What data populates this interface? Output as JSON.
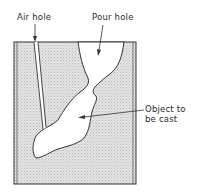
{
  "diagram": {
    "labels": {
      "air_hole": "Air hole",
      "pour_hole": "Pour hole",
      "object_line1": "Object to",
      "object_line2": "be cast"
    },
    "colors": {
      "mould_fill": "#d9d9d9",
      "outline": "#333333",
      "cavity": "#ffffff"
    }
  }
}
